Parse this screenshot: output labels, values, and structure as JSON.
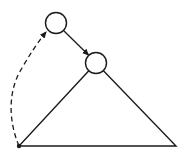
{
  "diagram": {
    "type": "tree-rotation-sketch",
    "stroke_color": "#1a1a1a",
    "background": "#ffffff",
    "nodes": [
      {
        "id": "top-node",
        "shape": "circle",
        "cx": 56,
        "cy": 23,
        "r": 10.5,
        "fill": "#ffffff"
      },
      {
        "id": "child-node",
        "shape": "circle",
        "cx": 96,
        "cy": 63,
        "r": 10.5,
        "fill": "#ffffff"
      },
      {
        "id": "origin-point",
        "shape": "dot",
        "cx": 19,
        "cy": 146,
        "r": 2.2
      }
    ],
    "triangle": {
      "apex": [
        96,
        63
      ],
      "left": [
        19,
        146
      ],
      "right": [
        176,
        146
      ]
    },
    "edges": [
      {
        "id": "solid-arrow",
        "style": "solid",
        "from": "top-node",
        "to": "child-node"
      },
      {
        "id": "dashed-arrow",
        "style": "dashed",
        "from": "origin-point",
        "to": "top-node"
      }
    ]
  }
}
